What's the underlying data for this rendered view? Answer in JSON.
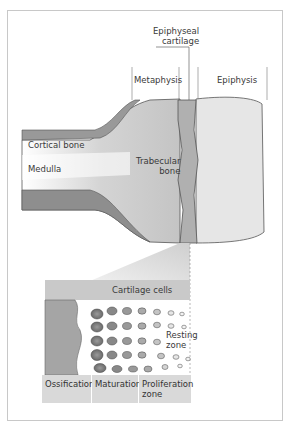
{
  "labels": {
    "epiphyseal_cartilage_line1": "Epiphyseal",
    "epiphyseal_cartilage_line2": "cartilage",
    "metaphysis": "Metaphysis",
    "epiphysis": "Epiphysis",
    "cortical_bone": "Cortical bone",
    "medulla": "Medulla",
    "trabecular_bone_line1": "Trabecular",
    "trabecular_bone_line2": "bone",
    "cartilage_cells": "Cartilage cells",
    "resting_zone_line1": "Resting",
    "resting_zone_line2": "zone"
  },
  "zones": [
    {
      "label": "Ossification"
    },
    {
      "label": "Maturation"
    },
    {
      "label": "Proliferation",
      "label2": "zone"
    }
  ],
  "colors": {
    "bone_gray": "#b8b8b8",
    "cortical_dark": "#8e8e8e",
    "label_box": "#d9d9d9",
    "frame": "#c8c8c8"
  }
}
